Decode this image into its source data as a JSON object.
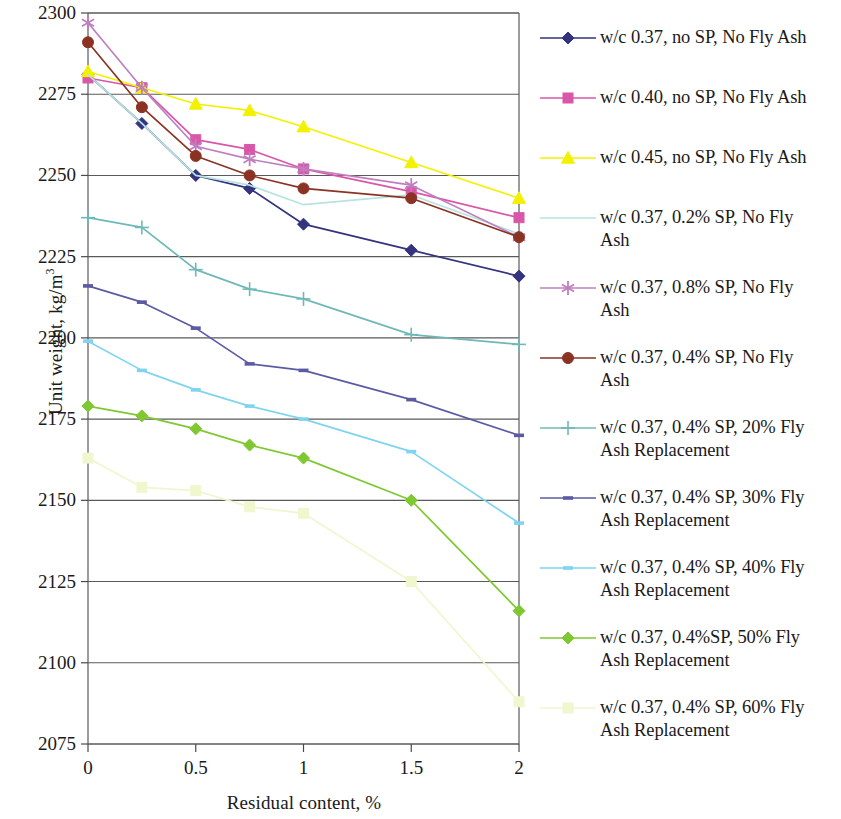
{
  "chart_data": {
    "type": "line",
    "title": "",
    "xlabel": "Residual content, %",
    "ylabel": "Unit weight, kg/m3",
    "ylabel_text": "Unit weight, kg/m",
    "ylabel_sup": "3",
    "x": [
      0,
      0.25,
      0.5,
      0.75,
      1,
      1.5,
      2
    ],
    "xlim": [
      0,
      2
    ],
    "ylim": [
      2075,
      2300
    ],
    "xticks": [
      "0",
      "0.5",
      "1",
      "1.5",
      "2"
    ],
    "xtick_values": [
      0,
      0.5,
      1,
      1.5,
      2
    ],
    "yticks": [
      "2075",
      "2100",
      "2125",
      "2150",
      "2175",
      "2200",
      "2225",
      "2250",
      "2275",
      "2300"
    ],
    "ytick_values": [
      2075,
      2100,
      2125,
      2150,
      2175,
      2200,
      2225,
      2250,
      2275,
      2300
    ],
    "grid": "horizontal",
    "legend_position": "right",
    "series": [
      {
        "name": "w/c 0.37, no SP, No Fly Ash",
        "color": "#33337f",
        "marker": "diamond",
        "values": [
          2281,
          2266,
          2250,
          2246,
          2235,
          2227,
          2219
        ]
      },
      {
        "name": "w/c 0.40, no SP, No Fly Ash",
        "color": "#d957a8",
        "marker": "square",
        "values": [
          2280,
          2277,
          2261,
          2258,
          2252,
          2245,
          2237
        ]
      },
      {
        "name": "w/c 0.45, no SP, No Fly Ash",
        "color": "#f2f200",
        "marker": "triangle",
        "values": [
          2282,
          2277,
          2272,
          2270,
          2265,
          2254,
          2243
        ]
      },
      {
        "name": "w/c 0.37, 0.2% SP, No Fly\nAsh",
        "color": "#b7e4e0",
        "marker": "none",
        "values": [
          2281,
          2266,
          2250,
          2247,
          2241,
          2244,
          2232
        ]
      },
      {
        "name": "w/c 0.37, 0.8% SP, No Fly\nAsh",
        "color": "#bf7fbf",
        "marker": "star",
        "values": [
          2297,
          2277,
          2259,
          2255,
          2252,
          2247,
          2231
        ]
      },
      {
        "name": "w/c 0.37, 0.4% SP, No Fly\nAsh",
        "color": "#8a3324",
        "marker": "circle",
        "values": [
          2291,
          2271,
          2256,
          2250,
          2246,
          2243,
          2231
        ]
      },
      {
        "name": "w/c 0.37, 0.4% SP, 20% Fly\nAsh Replacement",
        "color": "#6fb8b8",
        "marker": "plus",
        "values": [
          2237,
          2234,
          2221,
          2215,
          2212,
          2201,
          2198
        ]
      },
      {
        "name": "w/c 0.37, 0.4% SP, 30% Fly\nAsh Replacement",
        "color": "#5b5ba5",
        "marker": "dash",
        "values": [
          2216,
          2211,
          2203,
          2192,
          2190,
          2181,
          2170
        ]
      },
      {
        "name": "w/c 0.37, 0.4% SP, 40% Fly\nAsh Replacement",
        "color": "#7fd4ef",
        "marker": "dash",
        "values": [
          2199,
          2190,
          2184,
          2179,
          2175,
          2165,
          2143
        ]
      },
      {
        "name": "w/c 0.37, 0.4%SP, 50% Fly\nAsh Replacement",
        "color": "#7fc832",
        "marker": "diamond",
        "values": [
          2179,
          2176,
          2172,
          2167,
          2163,
          2150,
          2116
        ]
      },
      {
        "name": "w/c 0.37, 0.4% SP, 60% Fly\nAsh Replacement",
        "color": "#eff7cf",
        "marker": "square",
        "values": [
          2163,
          2154,
          2153,
          2148,
          2146,
          2125,
          2088
        ]
      }
    ]
  },
  "axis": {
    "y_title_text": "Unit weight, kg/m",
    "y_title_sup": "3",
    "x_title": "Residual content, %"
  }
}
